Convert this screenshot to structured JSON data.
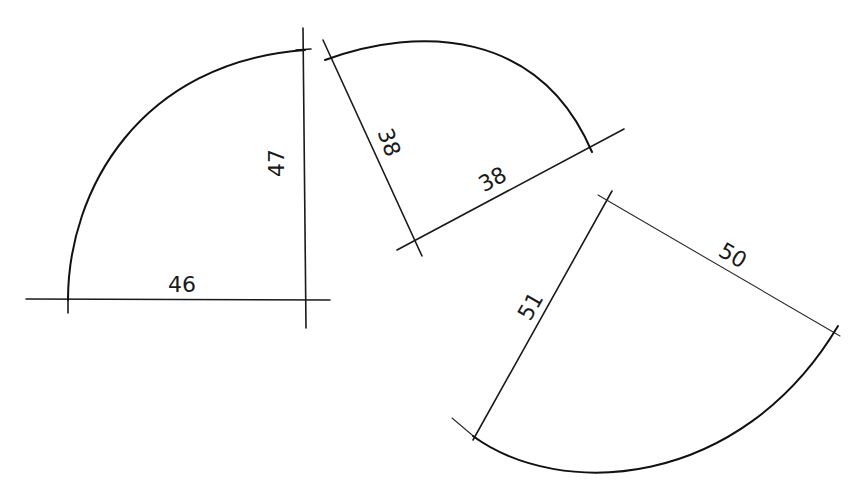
{
  "diagram": {
    "shapes": [
      {
        "id": "piece-1",
        "dimensions": [
          {
            "label": "46",
            "edge": "bottom"
          },
          {
            "label": "47",
            "edge": "right-vertical"
          }
        ]
      },
      {
        "id": "piece-2",
        "dimensions": [
          {
            "label": "38",
            "edge": "left-slanted"
          },
          {
            "label": "38",
            "edge": "bottom-slanted"
          }
        ]
      },
      {
        "id": "piece-3",
        "dimensions": [
          {
            "label": "51",
            "edge": "left-slanted"
          },
          {
            "label": "50",
            "edge": "top-slanted"
          }
        ]
      }
    ]
  },
  "labels": {
    "p1_bottom": "46",
    "p1_right": "47",
    "p2_left": "38",
    "p2_bottom": "38",
    "p3_left": "51",
    "p3_top": "50"
  },
  "colors": {
    "ink": "#1a1a1a",
    "paper": "#ffffff"
  }
}
